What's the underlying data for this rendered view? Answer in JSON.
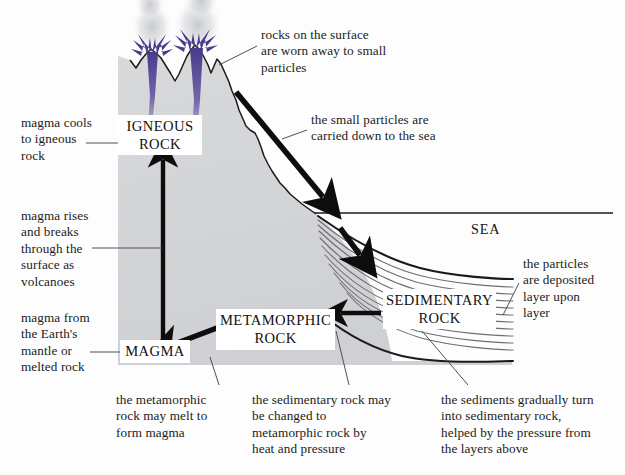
{
  "diagram": {
    "colors": {
      "rock_fill": "#d3d4d6",
      "rock_outline": "#1a1a1a",
      "lava_purple": "#4a3a8c",
      "smoke_gray": "#c9cacd",
      "arrow_black": "#0d0d0d",
      "leader_line": "#4a4a4a",
      "text": "#1b1b1b",
      "background": "#fdfdfd"
    }
  },
  "rock_labels": [
    {
      "name": "igneous-rock-label",
      "text": "IGNEOUS\nROCK",
      "x": 118,
      "y": 115,
      "w": 84,
      "h": 40
    },
    {
      "name": "magma-label",
      "text": "MAGMA",
      "x": 120,
      "y": 340,
      "w": 70,
      "h": 23
    },
    {
      "name": "metamorphic-rock-label",
      "text": "METAMORPHIC\nROCK",
      "x": 216,
      "y": 309,
      "w": 119,
      "h": 41
    },
    {
      "name": "sedimentary-rock-label",
      "text": "SEDIMENTARY\nROCK",
      "x": 383,
      "y": 289,
      "w": 113,
      "h": 40
    }
  ],
  "sea_label": {
    "text": "SEA",
    "x": 471,
    "y": 221
  },
  "captions": [
    {
      "name": "caption-rocks-worn-away",
      "text": "rocks on the surface\nare worn away to small\nparticles",
      "x": 261,
      "y": 27
    },
    {
      "name": "caption-particles-carried",
      "text": "the small particles are\ncarried down to the sea",
      "x": 311,
      "y": 112
    },
    {
      "name": "caption-magma-cools",
      "text": "magma cools\nto igneous\nrock",
      "x": 21,
      "y": 115
    },
    {
      "name": "caption-magma-rises",
      "text": "magma rises\nand breaks\nthrough the\nsurface as\nvolcanoes",
      "x": 21,
      "y": 208
    },
    {
      "name": "caption-magma-from-mantle",
      "text": "magma from\nthe Earth's\nmantle or\nmelted rock",
      "x": 21,
      "y": 310
    },
    {
      "name": "caption-particles-deposited",
      "text": "the particles\nare deposited\nlayer upon\nlayer",
      "x": 523,
      "y": 256
    },
    {
      "name": "caption-metamorphic-melt",
      "text": "the metamorphic\nrock may melt to\nform magma",
      "x": 116,
      "y": 392
    },
    {
      "name": "caption-sedimentary-to-metamorphic",
      "text": "the sedimentary rock may\nbe changed to\nmetamorphic rock by\nheat and pressure",
      "x": 252,
      "y": 392
    },
    {
      "name": "caption-sediments-turn",
      "text": "the sediments gradually turn\ninto sedimentary rock,\nhelped by the pressure from\nthe layers above",
      "x": 441,
      "y": 392
    }
  ],
  "process_arrows": [
    {
      "name": "arrow-magma-rising-upward",
      "direction": "up",
      "meaning": "magma rises to form igneous rock"
    },
    {
      "name": "arrow-weathering-down-to-sea",
      "direction": "down-right",
      "meaning": "particles carried down to the sea"
    },
    {
      "name": "arrow-particles-into-sediment",
      "direction": "down-right",
      "meaning": "particles deposited as sediment layers"
    },
    {
      "name": "arrow-sedimentary-to-metamorphic",
      "direction": "left",
      "meaning": "sedimentary rock becomes metamorphic rock"
    },
    {
      "name": "arrow-metamorphic-to-magma",
      "direction": "down-left",
      "meaning": "metamorphic rock melts to magma"
    }
  ]
}
